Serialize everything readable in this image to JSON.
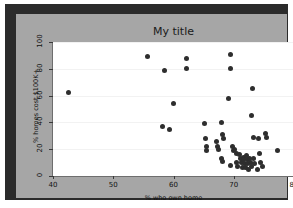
{
  "chart_data": {
    "type": "scatter",
    "title": "My title",
    "xlabel": "% who own home",
    "ylabel": "% homes cost $100K+",
    "xlim": [
      40,
      80
    ],
    "ylim": [
      0,
      100
    ],
    "xticks": [
      40,
      50,
      60,
      70,
      80
    ],
    "yticks": [
      0,
      20,
      40,
      60,
      80,
      100
    ],
    "grid": true,
    "legend": null,
    "marker_color": "#2e2e2e",
    "figure_background": "#a6a6a6",
    "axes_background": "#ffffff",
    "points": [
      {
        "x": 42.5,
        "y": 62
      },
      {
        "x": 55.7,
        "y": 89
      },
      {
        "x": 58.5,
        "y": 79
      },
      {
        "x": 60.0,
        "y": 54
      },
      {
        "x": 62.2,
        "y": 88
      },
      {
        "x": 62.2,
        "y": 80
      },
      {
        "x": 58.2,
        "y": 37
      },
      {
        "x": 59.4,
        "y": 35
      },
      {
        "x": 65.2,
        "y": 39
      },
      {
        "x": 65.3,
        "y": 28
      },
      {
        "x": 65.4,
        "y": 22
      },
      {
        "x": 65.4,
        "y": 19
      },
      {
        "x": 67.2,
        "y": 26
      },
      {
        "x": 67.3,
        "y": 22
      },
      {
        "x": 67.4,
        "y": 20
      },
      {
        "x": 68.0,
        "y": 40
      },
      {
        "x": 68.2,
        "y": 31
      },
      {
        "x": 68.3,
        "y": 28
      },
      {
        "x": 68.0,
        "y": 13
      },
      {
        "x": 68.1,
        "y": 11
      },
      {
        "x": 69.5,
        "y": 91
      },
      {
        "x": 69.5,
        "y": 80
      },
      {
        "x": 69.2,
        "y": 58
      },
      {
        "x": 69.8,
        "y": 22
      },
      {
        "x": 69.9,
        "y": 19
      },
      {
        "x": 69.5,
        "y": 8
      },
      {
        "x": 70.2,
        "y": 20
      },
      {
        "x": 70.4,
        "y": 17
      },
      {
        "x": 70.5,
        "y": 10
      },
      {
        "x": 70.7,
        "y": 7
      },
      {
        "x": 71.0,
        "y": 16
      },
      {
        "x": 71.2,
        "y": 13
      },
      {
        "x": 71.3,
        "y": 10
      },
      {
        "x": 71.4,
        "y": 6
      },
      {
        "x": 71.6,
        "y": 14
      },
      {
        "x": 71.7,
        "y": 12
      },
      {
        "x": 71.8,
        "y": 9
      },
      {
        "x": 71.9,
        "y": 6
      },
      {
        "x": 72.1,
        "y": 15
      },
      {
        "x": 72.2,
        "y": 12
      },
      {
        "x": 72.3,
        "y": 9
      },
      {
        "x": 72.4,
        "y": 5
      },
      {
        "x": 72.6,
        "y": 13
      },
      {
        "x": 72.8,
        "y": 10
      },
      {
        "x": 72.9,
        "y": 7
      },
      {
        "x": 73.0,
        "y": 45
      },
      {
        "x": 73.1,
        "y": 65
      },
      {
        "x": 73.2,
        "y": 29
      },
      {
        "x": 73.3,
        "y": 13
      },
      {
        "x": 73.5,
        "y": 9
      },
      {
        "x": 73.9,
        "y": 5
      },
      {
        "x": 74.1,
        "y": 28
      },
      {
        "x": 74.3,
        "y": 17
      },
      {
        "x": 74.5,
        "y": 10
      },
      {
        "x": 74.8,
        "y": 7
      },
      {
        "x": 75.2,
        "y": 32
      },
      {
        "x": 75.4,
        "y": 29
      },
      {
        "x": 77.3,
        "y": 19
      }
    ]
  }
}
